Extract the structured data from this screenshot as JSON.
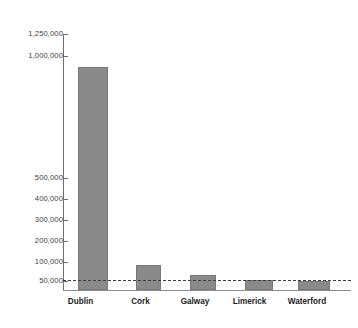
{
  "chart_data": {
    "type": "bar",
    "title": "",
    "xlabel": "",
    "ylabel": "",
    "categories": [
      "Dublin",
      "Cork",
      "Galway",
      "Limerick",
      "Waterford"
    ],
    "values": [
      1090000,
      120000,
      75000,
      50000,
      45000
    ],
    "ylim": [
      0,
      1250000
    ],
    "ytick_values": [
      50000,
      100000,
      200000,
      300000,
      400000,
      500000,
      1000000,
      1250000
    ],
    "ytick_labels": [
      "50,000",
      "100,000",
      "200,000",
      "300,000",
      "400,000",
      "500,000",
      "1,000,000",
      "1,250,000"
    ],
    "grid": false,
    "legend": null,
    "annotations": [
      {
        "type": "reference-line",
        "value": 50000,
        "label": "50,000",
        "style": "dashed"
      }
    ],
    "series": [
      {
        "name": "Population",
        "values": [
          1090000,
          120000,
          75000,
          50000,
          45000
        ],
        "color": "#8a8a8a"
      }
    ],
    "colors": {
      "bar_fill": "#8a8a8a",
      "bar_edge": "#787878",
      "axis": "#6e6e6e",
      "tick_text": "#3d3d3d",
      "category_text": "#1c1c1c",
      "reference_line": "#3f3f3f",
      "background": "#ffffff"
    }
  }
}
